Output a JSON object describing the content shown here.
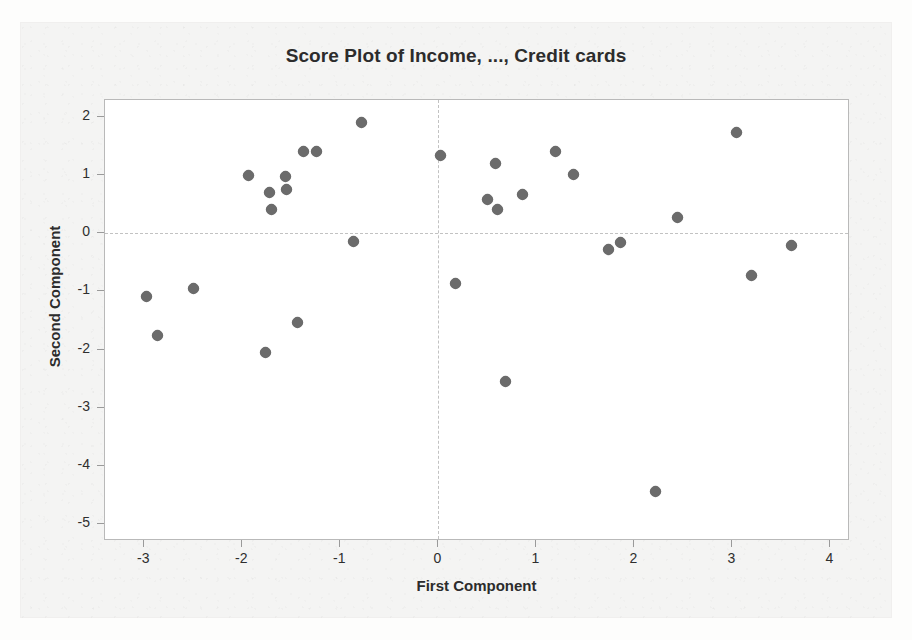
{
  "chart_data": {
    "type": "scatter",
    "title": "Score Plot of Income, ..., Credit cards",
    "xlabel": "First Component",
    "ylabel": "Second Component",
    "xlim": [
      -3.4,
      4.2
    ],
    "ylim": [
      -5.3,
      2.3
    ],
    "xticks": [
      -3,
      -2,
      -1,
      0,
      1,
      2,
      3,
      4
    ],
    "yticks": [
      2,
      1,
      0,
      -1,
      -2,
      -3,
      -4,
      -5
    ],
    "xtick_labels": [
      "-3",
      "-2",
      "-1",
      "0",
      "1",
      "2",
      "3",
      "4"
    ],
    "ytick_labels": [
      "2",
      "1",
      "0",
      "-1",
      "-2",
      "-3",
      "-4",
      "-5"
    ],
    "grid": false,
    "legend": null,
    "reference_lines": {
      "vertical_x": 0,
      "horizontal_y": 0,
      "style": "dashed"
    },
    "marker_color": "#6b6b6b",
    "marker_shape": "diamond",
    "points": [
      {
        "x": -2.98,
        "y": -1.08
      },
      {
        "x": -2.86,
        "y": -1.76
      },
      {
        "x": -2.5,
        "y": -0.94
      },
      {
        "x": -1.94,
        "y": 1.0
      },
      {
        "x": -1.76,
        "y": -2.05
      },
      {
        "x": -1.72,
        "y": 0.7
      },
      {
        "x": -1.7,
        "y": 0.42
      },
      {
        "x": -1.56,
        "y": 0.98
      },
      {
        "x": -1.55,
        "y": 0.76
      },
      {
        "x": -1.44,
        "y": -1.53
      },
      {
        "x": -1.38,
        "y": 1.41
      },
      {
        "x": -1.24,
        "y": 1.41
      },
      {
        "x": -0.86,
        "y": -0.14
      },
      {
        "x": -0.78,
        "y": 1.92
      },
      {
        "x": 0.02,
        "y": 1.34
      },
      {
        "x": 0.18,
        "y": -0.87
      },
      {
        "x": 0.5,
        "y": 0.58
      },
      {
        "x": 0.58,
        "y": 1.2
      },
      {
        "x": 0.6,
        "y": 0.42
      },
      {
        "x": 0.69,
        "y": -2.55
      },
      {
        "x": 0.86,
        "y": 0.68
      },
      {
        "x": 1.2,
        "y": 1.41
      },
      {
        "x": 1.38,
        "y": 1.02
      },
      {
        "x": 1.74,
        "y": -0.28
      },
      {
        "x": 1.86,
        "y": -0.15
      },
      {
        "x": 2.22,
        "y": -4.45
      },
      {
        "x": 2.44,
        "y": 0.28
      },
      {
        "x": 3.04,
        "y": 1.74
      },
      {
        "x": 3.2,
        "y": -0.72
      },
      {
        "x": 3.6,
        "y": -0.2
      }
    ]
  }
}
